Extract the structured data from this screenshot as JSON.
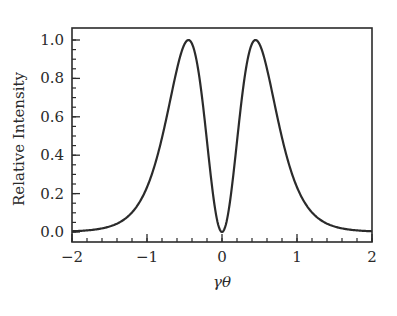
{
  "chart_data": {
    "type": "line",
    "title": "",
    "xlabel": "γθ",
    "ylabel": "Relative Intensity",
    "xlim": [
      -2,
      2
    ],
    "ylim": [
      -0.04,
      1.05
    ],
    "x_ticks": [
      -2,
      -1,
      0,
      1,
      2
    ],
    "x_tick_labels": [
      "−2",
      "−1",
      "0",
      "1",
      "2"
    ],
    "x_minor_step": 0.2,
    "y_ticks": [
      0.0,
      0.2,
      0.4,
      0.6,
      0.8,
      1.0
    ],
    "y_tick_labels": [
      "0.0",
      "0.2",
      "0.4",
      "0.6",
      "0.8",
      "1.0"
    ],
    "y_minor_step": 0.05,
    "grid": false,
    "legend": "none",
    "line_color": "#2b2b2b",
    "series": [
      {
        "name": "Relative Intensity",
        "model": "normalized u^2/(1+u^2)^6",
        "x": [
          -2.0,
          -1.75,
          -1.5,
          -1.25,
          -1.0,
          -0.8,
          -0.7,
          -0.6,
          -0.5,
          -0.45,
          -0.4,
          -0.3,
          -0.2,
          -0.1,
          0.0,
          0.1,
          0.2,
          0.3,
          0.4,
          0.45,
          0.5,
          0.6,
          0.7,
          0.8,
          1.0,
          1.25,
          1.5,
          1.75,
          2.0
        ],
        "y": [
          0.015,
          0.025,
          0.043,
          0.085,
          0.233,
          0.446,
          0.594,
          0.751,
          0.898,
          1.0,
          0.982,
          0.866,
          0.527,
          0.158,
          0.0,
          0.158,
          0.527,
          0.866,
          0.982,
          1.0,
          0.898,
          0.751,
          0.594,
          0.446,
          0.233,
          0.085,
          0.043,
          0.025,
          0.015
        ]
      }
    ]
  }
}
